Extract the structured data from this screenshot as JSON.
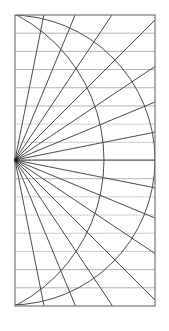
{
  "canvas": {
    "width": 169,
    "height": 331,
    "background": "#ffffff"
  },
  "diagram": {
    "type": "radial-ray-grid",
    "frame": {
      "x": 15,
      "y": 15,
      "width": 140,
      "height": 291,
      "stroke": "#777777",
      "stroke_width": 1.2
    },
    "origin": {
      "x": 15,
      "y": 160
    },
    "horizontal_lines": {
      "count": 15,
      "stroke": "#b4b4b4",
      "stroke_width": 1,
      "dotted_indices": [
        6,
        7,
        10,
        11,
        12,
        13
      ]
    },
    "rays": {
      "stroke": "#4a4a4a",
      "stroke_width": 1,
      "angles_from_vertical_deg": [
        11.25,
        22.5,
        33.75,
        45,
        56.25,
        67.5,
        78.75,
        90,
        101.25,
        112.5,
        123.75,
        135,
        146.25,
        157.5,
        168.75
      ]
    },
    "arcs": [
      {
        "name": "outer-arc",
        "cx": 10,
        "cy": 160,
        "r": 145,
        "stroke": "#4a4a4a",
        "stroke_width": 1
      },
      {
        "name": "inner-arc",
        "cx": -60,
        "cy": 160,
        "r": 164,
        "stroke": "#4a4a4a",
        "stroke_width": 1
      }
    ]
  }
}
